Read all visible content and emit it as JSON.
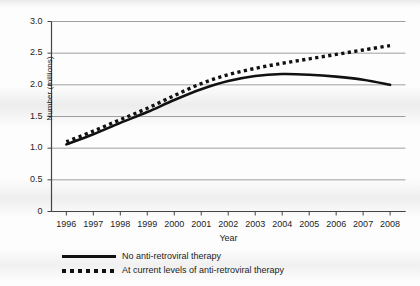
{
  "chart_data": {
    "type": "line",
    "title": "",
    "xlabel": "Year",
    "ylabel": "Number (millions)",
    "categories": [
      "1996",
      "1997",
      "1998",
      "1999",
      "2000",
      "2001",
      "2002",
      "2003",
      "2004",
      "2005",
      "2006",
      "2007",
      "2008"
    ],
    "x": [
      1996,
      1997,
      1998,
      1999,
      2000,
      2001,
      2002,
      2003,
      2004,
      2005,
      2006,
      2007,
      2008
    ],
    "ylim": [
      0,
      3.0
    ],
    "xlim": [
      1996,
      2008
    ],
    "yticks": [
      "0",
      "0.5",
      "1.0",
      "1.5",
      "2.0",
      "2.5",
      "3.0"
    ],
    "ytick_values": [
      0,
      0.5,
      1.0,
      1.5,
      2.0,
      2.5,
      3.0
    ],
    "grid": "horizontal",
    "legend_position": "below-axis-left",
    "series": [
      {
        "name": "No anti-retroviral therapy",
        "style": "solid",
        "color": "#111111",
        "values": [
          1.06,
          1.22,
          1.4,
          1.57,
          1.76,
          1.93,
          2.06,
          2.14,
          2.17,
          2.16,
          2.13,
          2.08,
          2.0
        ]
      },
      {
        "name": "At current levels of anti-retroviral therapy",
        "style": "dotted",
        "color": "#111111",
        "values": [
          1.1,
          1.27,
          1.45,
          1.63,
          1.83,
          2.02,
          2.16,
          2.26,
          2.34,
          2.41,
          2.48,
          2.55,
          2.62
        ]
      }
    ]
  },
  "legend": {
    "items": [
      {
        "label": "No anti-retroviral therapy",
        "style": "solid"
      },
      {
        "label": "At current levels of anti-retroviral therapy",
        "style": "dotted"
      }
    ]
  }
}
